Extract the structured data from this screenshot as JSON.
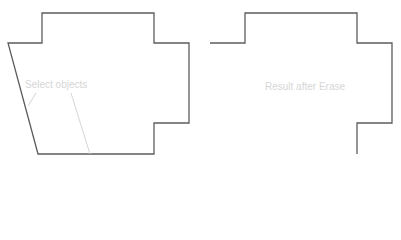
{
  "diagram": {
    "colors": {
      "outline": "#5c5c5c",
      "annotation": "#d6d6d6",
      "background": "#ffffff"
    },
    "left_panel": {
      "label": "Select objects",
      "shape": "closed polygon with slanted left edge"
    },
    "right_panel": {
      "label": "Result after Erase",
      "shape": "open polyline (left and bottom edges erased)"
    }
  }
}
